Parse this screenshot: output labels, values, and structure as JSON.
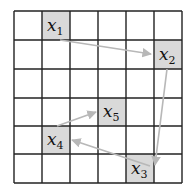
{
  "grid": {
    "rows": 6,
    "cols": 6,
    "x_lines": [
      14,
      42,
      70,
      98,
      126,
      154,
      182
    ],
    "y_lines": [
      11,
      40,
      69,
      98,
      126,
      154,
      183
    ],
    "line_color": "#222222",
    "cell_fill": "#ffffff",
    "highlight_fill": "#d9d9d9"
  },
  "nodes": [
    {
      "id": "x1",
      "base": "x",
      "sub": "1",
      "col": 1,
      "row": 0
    },
    {
      "id": "x2",
      "base": "x",
      "sub": "2",
      "col": 5,
      "row": 1
    },
    {
      "id": "x3",
      "base": "x",
      "sub": "3",
      "col": 4,
      "row": 5
    },
    {
      "id": "x4",
      "base": "x",
      "sub": "4",
      "col": 1,
      "row": 4
    },
    {
      "id": "x5",
      "base": "x",
      "sub": "5",
      "col": 3,
      "row": 3
    }
  ],
  "arrows": [
    {
      "from": "x1",
      "to": "x2",
      "x1": 60,
      "y1": 40,
      "x2": 151,
      "y2": 54
    },
    {
      "from": "x2",
      "to": "x3",
      "x1": 167,
      "y1": 69,
      "x2": 155,
      "y2": 165
    },
    {
      "from": "x3",
      "to": "x4",
      "x1": 150,
      "y1": 166,
      "x2": 72,
      "y2": 140
    },
    {
      "from": "x4",
      "to": "x5",
      "x1": 57,
      "y1": 126,
      "x2": 96,
      "y2": 112
    }
  ],
  "arrow_color": "#b8b8b8"
}
